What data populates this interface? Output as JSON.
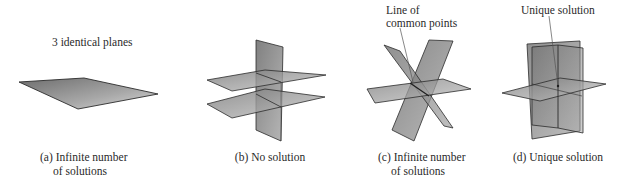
{
  "figure": {
    "panels": [
      {
        "id": "a",
        "annotation": "3 identical planes",
        "caption_line1": "(a) Infinite number",
        "caption_line2": "of solutions"
      },
      {
        "id": "b",
        "caption_line1": "(b) No solution"
      },
      {
        "id": "c",
        "annotation_line1": "Line of",
        "annotation_line2": "common points",
        "caption_line1": "(c) Infinite number",
        "caption_line2": "of solutions"
      },
      {
        "id": "d",
        "annotation": "Unique solution",
        "caption_line1": "(d) Unique solution"
      }
    ],
    "colors": {
      "plane_fill": "#8c8c8c",
      "plane_edge": "#2b2b2b",
      "leader_line": "#555555",
      "text": "#2a2a2a"
    }
  }
}
